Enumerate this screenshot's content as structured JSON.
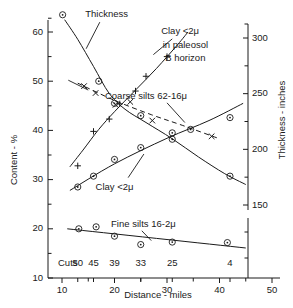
{
  "chart_data": {
    "type": "scatter",
    "title": "",
    "xlabel": "Distance - miles",
    "ylabel": "Content - %",
    "y2label": "Thickness - inches",
    "xlim": [
      8,
      52
    ],
    "ylim": [
      10,
      64
    ],
    "y2lim": [
      130,
      320
    ],
    "grid": false,
    "legend": "inline-annotations",
    "xticks": [
      10,
      20,
      30,
      40,
      50
    ],
    "xticklabels": [
      "10",
      "20",
      "30",
      "40",
      "50"
    ],
    "xminorticks": [
      15,
      25,
      35,
      45
    ],
    "yticks": [
      10,
      20,
      30,
      40,
      50,
      60
    ],
    "yticklabels": [
      "10",
      "20",
      "30",
      "40",
      "50",
      "60"
    ],
    "yminorticks": [
      15,
      25,
      35,
      45,
      55
    ],
    "y2ticks": [
      150,
      200,
      250,
      300
    ],
    "y2ticklabels": [
      "150",
      "200",
      "250",
      "300"
    ],
    "y2minorticks": [
      175,
      225,
      275
    ],
    "cuts_row_label": "Cuts",
    "cuts": [
      {
        "label": "50",
        "x": 13
      },
      {
        "label": "45",
        "x": 16
      },
      {
        "label": "39",
        "x": 20
      },
      {
        "label": "33",
        "x": 25
      },
      {
        "label": "25",
        "x": 31
      },
      {
        "label": "4",
        "x": 42
      }
    ],
    "series": [
      {
        "name": "Thickness",
        "label": "Thickness",
        "marker": "circle-dot",
        "axis": "right",
        "points": [
          {
            "x": 17,
            "y": 50.0
          },
          {
            "x": 20,
            "y": 45.5
          },
          {
            "x": 25,
            "y": 43.0
          },
          {
            "x": 31,
            "y": 38.2
          },
          {
            "x": 42,
            "y": 30.7
          }
        ],
        "curve": [
          {
            "x": 10.5,
            "y": 62.5
          },
          {
            "x": 13,
            "y": 58.5
          },
          {
            "x": 16,
            "y": 53.0
          },
          {
            "x": 19,
            "y": 47.5
          },
          {
            "x": 22,
            "y": 44.3
          },
          {
            "x": 26,
            "y": 41.6
          },
          {
            "x": 31,
            "y": 38.3
          },
          {
            "x": 36,
            "y": 34.6
          },
          {
            "x": 41,
            "y": 31.2
          },
          {
            "x": 45,
            "y": 29.0
          }
        ]
      },
      {
        "name": "Clay <2u in paleosol B horizon",
        "label": "Clay  <2μ",
        "label_line2": "in paleosol",
        "label_line3": "B horizon",
        "marker": "plus",
        "axis": "left",
        "points": [
          {
            "x": 13,
            "y": 32.8
          },
          {
            "x": 16,
            "y": 39.8
          },
          {
            "x": 19,
            "y": 42.3
          },
          {
            "x": 21,
            "y": 45.4
          },
          {
            "x": 24,
            "y": 48.0
          },
          {
            "x": 26,
            "y": 51.0
          },
          {
            "x": 30,
            "y": 55.0
          }
        ],
        "curve": [
          {
            "x": 11.5,
            "y": 32.6
          },
          {
            "x": 14,
            "y": 36.0
          },
          {
            "x": 17,
            "y": 40.2
          },
          {
            "x": 20,
            "y": 43.8
          },
          {
            "x": 24,
            "y": 48.2
          },
          {
            "x": 28,
            "y": 52.6
          },
          {
            "x": 32,
            "y": 57.4
          },
          {
            "x": 34,
            "y": 60.0
          }
        ]
      },
      {
        "name": "Coarse silts 62-16u",
        "label": "Coarse silts  62-16μ",
        "marker": "x",
        "axis": "left",
        "points": [
          {
            "x": 14.2,
            "y": 49.0
          },
          {
            "x": 16.4,
            "y": 47.6
          },
          {
            "x": 20.2,
            "y": 45.2
          },
          {
            "x": 23.0,
            "y": 45.8
          },
          {
            "x": 27.2,
            "y": 42.0
          },
          {
            "x": 38.5,
            "y": 38.8
          }
        ],
        "curve": [
          {
            "x": 13.0,
            "y": 49.6
          },
          {
            "x": 20.0,
            "y": 46.1
          },
          {
            "x": 27.0,
            "y": 43.2
          },
          {
            "x": 33.0,
            "y": 41.0
          },
          {
            "x": 40.0,
            "y": 38.3
          }
        ],
        "linestyle": "dashed"
      },
      {
        "name": "Clay <2u",
        "label": "Clay  <2μ",
        "marker": "circle-dot",
        "axis": "left",
        "points": [
          {
            "x": 13.0,
            "y": 28.5
          },
          {
            "x": 16.0,
            "y": 30.7
          },
          {
            "x": 20.0,
            "y": 34.1
          },
          {
            "x": 25.0,
            "y": 36.5
          },
          {
            "x": 31.0,
            "y": 39.5
          },
          {
            "x": 34.5,
            "y": 40.2
          },
          {
            "x": 42.0,
            "y": 42.6
          }
        ],
        "curve": [
          {
            "x": 11.5,
            "y": 27.8
          },
          {
            "x": 20.0,
            "y": 33.2
          },
          {
            "x": 30.0,
            "y": 38.4
          },
          {
            "x": 38.0,
            "y": 42.0
          },
          {
            "x": 44.5,
            "y": 45.5
          }
        ]
      },
      {
        "name": "Fine silts 16-2u",
        "label": "Fine silts  16-2μ",
        "marker": "circle-dot",
        "axis": "left",
        "points": [
          {
            "x": 13.2,
            "y": 20.0
          },
          {
            "x": 16.5,
            "y": 20.4
          },
          {
            "x": 20.0,
            "y": 18.5
          },
          {
            "x": 25.0,
            "y": 16.8
          },
          {
            "x": 31.0,
            "y": 17.3
          },
          {
            "x": 41.5,
            "y": 17.2
          }
        ],
        "curve": [
          {
            "x": 11.0,
            "y": 20.0
          },
          {
            "x": 45.0,
            "y": 16.1
          }
        ]
      }
    ],
    "annotations": [
      {
        "text": "Thickness",
        "x": 18.5,
        "y": 63.5
      },
      {
        "text": "Clay  <2μ",
        "x": 32.5,
        "y": 60.2
      },
      {
        "text": "in paleosol",
        "x": 33.5,
        "y": 57.3
      },
      {
        "text": "B horizon",
        "x": 33.5,
        "y": 54.6
      },
      {
        "text": "Coarse silts  62-16μ",
        "x": 26.0,
        "y": 46.8
      },
      {
        "text": "Clay  <2μ",
        "x": 20.0,
        "y": 28.4
      },
      {
        "text": "Fine silts  16-2μ",
        "x": 25.5,
        "y": 20.8
      }
    ]
  }
}
